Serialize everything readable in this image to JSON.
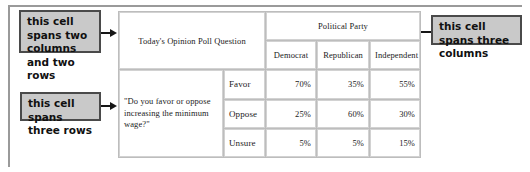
{
  "callouts": [
    {
      "name": "two-columns-two-rows",
      "text": "this cell spans two columns and two rows"
    },
    {
      "name": "three-rows",
      "text": "this cell spans three rows"
    },
    {
      "name": "three-columns",
      "text": "this cell spans three columns"
    }
  ],
  "table": {
    "question_header": "Today's Opinion Poll Question",
    "group_header": "Political Party",
    "column_headers": [
      "Democrat",
      "Republican",
      "Independent"
    ],
    "question_text": "\"Do you favor or oppose increasing the minimum wage?\"",
    "row_labels": [
      "Favor",
      "Oppose",
      "Unsure"
    ],
    "rows": [
      {
        "label": "Favor",
        "values": [
          "70%",
          "35%",
          "55%"
        ]
      },
      {
        "label": "Oppose",
        "values": [
          "25%",
          "60%",
          "30%"
        ]
      },
      {
        "label": "Unsure",
        "values": [
          "5%",
          "5%",
          "15%"
        ]
      }
    ]
  },
  "colors": {
    "callout_fill": "#c9c9c9",
    "callout_border": "#4a4a4a",
    "table_grid": "#d2d2d2",
    "frame": "#9a9a9a"
  }
}
